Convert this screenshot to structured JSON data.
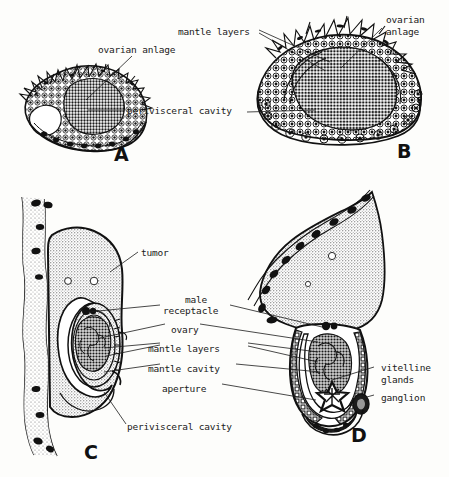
{
  "figure": {
    "background_color": "#fdfdfb",
    "ink_color": "#111111",
    "panels": [
      {
        "id": "A",
        "letter": "A"
      },
      {
        "id": "B",
        "letter": "B"
      },
      {
        "id": "C",
        "letter": "C"
      },
      {
        "id": "D",
        "letter": "D"
      }
    ]
  },
  "labels": {
    "a_ovarian_anlage": "ovarian anlage",
    "a_perivisceral_cavity": "perivisceral cavity",
    "b_mantle_layers": "mantle layers",
    "b_ovarian_anlage_line1": "ovarian",
    "b_ovarian_anlage_line2": "anlage",
    "c_tumor": "tumor",
    "cd_male_line1": "male",
    "cd_male_line2": "receptacle",
    "cd_ovary": "ovary",
    "cd_mantle_layers": "mantle layers",
    "cd_mantle_cavity": "mantle cavity",
    "cd_aperture": "aperture",
    "c_perivisceral_cavity": "perivisceral cavity",
    "d_vitelline_line1": "vitelline",
    "d_vitelline_line2": "glands",
    "d_ganglion": "ganglion"
  },
  "panel_letters": {
    "a": "A",
    "b": "B",
    "c": "C",
    "d": "D"
  }
}
